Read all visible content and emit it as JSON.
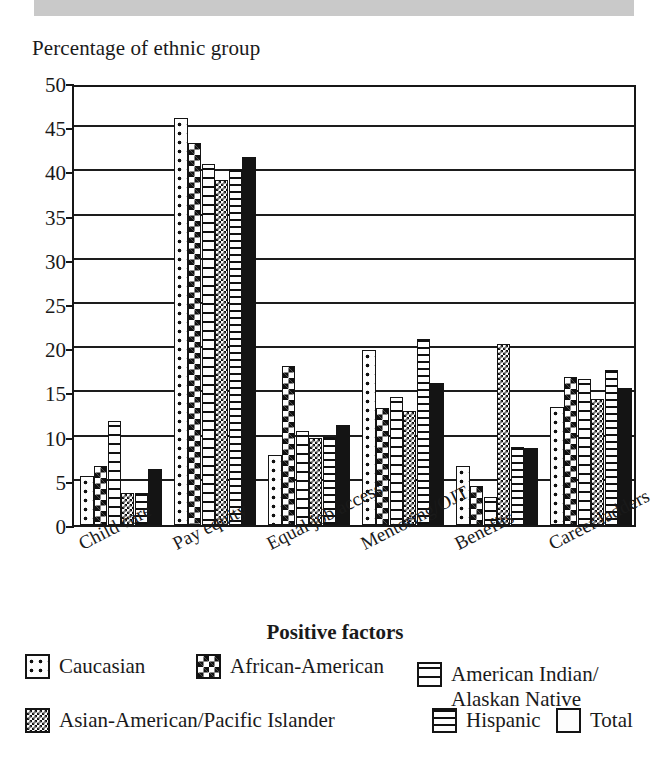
{
  "banner": {
    "name": "page-header-band"
  },
  "chart_data": {
    "type": "bar",
    "title": "Percentage of ethnic group",
    "xlabel": "Positive factors",
    "ylabel": "Percentage of ethnic group",
    "ylim": [
      0,
      50
    ],
    "yticks": [
      0,
      5,
      10,
      15,
      20,
      25,
      30,
      35,
      40,
      45,
      50
    ],
    "grid": true,
    "legend_position": "bottom",
    "categories": [
      "Child care",
      "Pay equity",
      "Equal job access",
      "Mentoring/OJT",
      "Benefits",
      "Career ladders"
    ],
    "series": [
      {
        "name": "Caucasian",
        "pattern": "sparse-dots",
        "values": [
          5.5,
          46.0,
          7.9,
          19.8,
          6.7,
          13.4
        ]
      },
      {
        "name": "African-American",
        "pattern": "checkerboard",
        "values": [
          6.7,
          43.2,
          18.0,
          13.2,
          4.4,
          16.8
        ]
      },
      {
        "name": "American Indian/\nAlaskan Native",
        "pattern": "dashes",
        "values": [
          11.8,
          40.8,
          10.6,
          14.5,
          3.2,
          16.5
        ]
      },
      {
        "name": "Asian-American/Pacific Islander",
        "pattern": "fine-check",
        "values": [
          3.6,
          39.0,
          9.8,
          12.9,
          20.5,
          14.3
        ]
      },
      {
        "name": "Hispanic",
        "pattern": "horizontal-lines",
        "values": [
          3.6,
          40.3,
          9.9,
          21.0,
          8.8,
          17.5
        ]
      },
      {
        "name": "Total",
        "pattern": "solid-black",
        "values": [
          6.3,
          41.6,
          11.3,
          16.1,
          8.7,
          15.5
        ]
      }
    ]
  },
  "colors": {
    "ink": "#141414",
    "banner": "#c9c9c9",
    "plot_background": "#ffffff"
  }
}
